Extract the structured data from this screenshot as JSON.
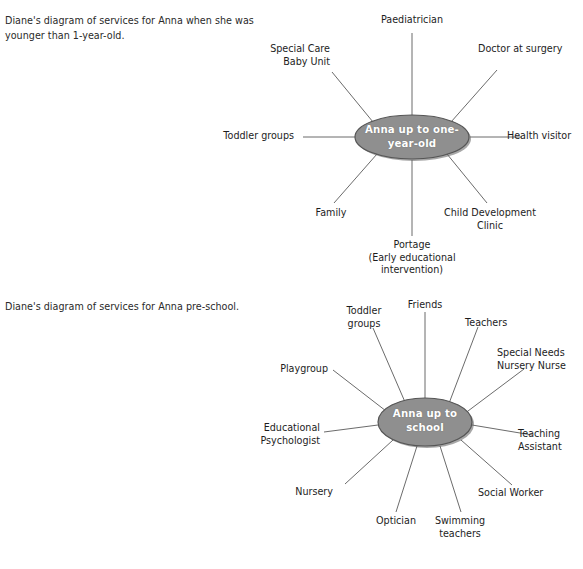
{
  "document": {
    "title": "Diane's diagrams of services for Anna",
    "background_color": "#ffffff",
    "text_color": "#1d1d1d"
  },
  "diagram_style": {
    "hub_fill": "#8f8f8f",
    "hub_stroke": "#555555",
    "hub_text_color": "#ffffff",
    "spoke_color": "#6b6b6b"
  },
  "diagram1": {
    "caption": "Diane's diagram of services for Anna when she was younger than 1-year-old.",
    "hub": {
      "label": "Anna up to one-year-old"
    },
    "nodes": [
      {
        "label": "Paediatrician"
      },
      {
        "label": "Doctor at surgery"
      },
      {
        "label": "Health visitor"
      },
      {
        "label": "Child Development\nClinic"
      },
      {
        "label": "Portage\n(Early educational\nintervention)"
      },
      {
        "label": "Family"
      },
      {
        "label": "Toddler groups"
      },
      {
        "label": "Special Care\nBaby Unit"
      }
    ]
  },
  "diagram2": {
    "caption": "Diane's diagram of services for Anna pre-school.",
    "hub": {
      "label": "Anna up to school"
    },
    "nodes": [
      {
        "label": "Friends"
      },
      {
        "label": "Teachers"
      },
      {
        "label": "Special Needs\nNursery Nurse"
      },
      {
        "label": "Teaching\nAssistant"
      },
      {
        "label": "Social Worker"
      },
      {
        "label": "Swimming\nteachers"
      },
      {
        "label": "Optician"
      },
      {
        "label": "Nursery"
      },
      {
        "label": "Educational\nPsychologist"
      },
      {
        "label": "Playgroup"
      },
      {
        "label": "Toddler\ngroups"
      }
    ]
  }
}
